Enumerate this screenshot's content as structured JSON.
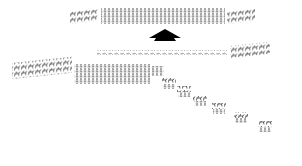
{
  "diagram": {
    "type": "battle-formation",
    "colors": {
      "unit": "#6a6a6a",
      "unit_dark": "#3a3a3a",
      "arrow": "#000000",
      "background": "#ffffff"
    },
    "formations": [
      {
        "id": "top-left-cavalry",
        "kind": "cavalry",
        "x": 70,
        "y": 12,
        "w": 28,
        "h": 12
      },
      {
        "id": "top-center-infantry",
        "kind": "infantry",
        "x": 101,
        "y": 8,
        "w": 124,
        "h": 16
      },
      {
        "id": "top-right-cavalry",
        "kind": "cavalry",
        "x": 227,
        "y": 12,
        "w": 28,
        "h": 12
      },
      {
        "id": "middle-line-infantry",
        "kind": "infantry-line",
        "x": 97,
        "y": 50,
        "w": 130,
        "h": 6
      },
      {
        "id": "middle-right-cavalry",
        "kind": "cavalry",
        "x": 230,
        "y": 46,
        "w": 40,
        "h": 12
      },
      {
        "id": "lower-left-cavalry",
        "kind": "cavalry",
        "x": 12,
        "y": 63,
        "w": 60,
        "h": 16
      },
      {
        "id": "lower-center-infantry",
        "kind": "infantry",
        "x": 74,
        "y": 64,
        "w": 76,
        "h": 20
      },
      {
        "id": "lower-small-infantry",
        "kind": "infantry",
        "x": 152,
        "y": 66,
        "w": 12,
        "h": 10
      }
    ],
    "echelon": [
      {
        "x": 162,
        "y": 78
      },
      {
        "x": 177,
        "y": 86
      },
      {
        "x": 193,
        "y": 95
      },
      {
        "x": 212,
        "y": 103
      },
      {
        "x": 234,
        "y": 112
      },
      {
        "x": 258,
        "y": 121
      }
    ],
    "arrow": {
      "direction": "up",
      "x": 149,
      "y": 29,
      "w": 32,
      "h": 12
    }
  }
}
